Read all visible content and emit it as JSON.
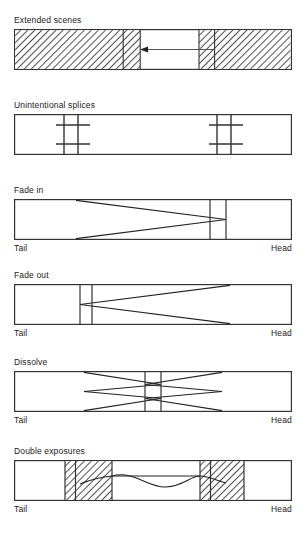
{
  "figure": {
    "type": "film-strip-editing-notation-diagram",
    "colors": {
      "ink": "#1a1a1a",
      "line": "#333333",
      "background": "#ffffff",
      "hatch": "#222222",
      "arrow": "#555555"
    },
    "end_labels": {
      "tail": "Tail",
      "head": "Head"
    }
  },
  "panels": [
    {
      "id": "extended-scenes",
      "title": "Extended scenes",
      "has_end_labels": false,
      "marks": "two hatched blocks separated by a clear span with a leftward arrow"
    },
    {
      "id": "unintentional-splices",
      "title": "Unintentional splices",
      "has_end_labels": false,
      "marks": "two splice cross-hatch marks, one near tail one near head"
    },
    {
      "id": "fade-in",
      "title": "Fade in",
      "has_end_labels": true,
      "marks": "long taper converging to a narrow band near the head"
    },
    {
      "id": "fade-out",
      "title": "Fade out",
      "has_end_labels": true,
      "marks": "narrow band near the tail diverging toward the head"
    },
    {
      "id": "dissolve",
      "title": "Dissolve",
      "has_end_labels": true,
      "marks": "two opposing tapers meeting at a central band"
    },
    {
      "id": "double-exposures",
      "title": "Double exposures",
      "has_end_labels": true,
      "marks": "two hatched blocks joined by a wavy line"
    }
  ]
}
